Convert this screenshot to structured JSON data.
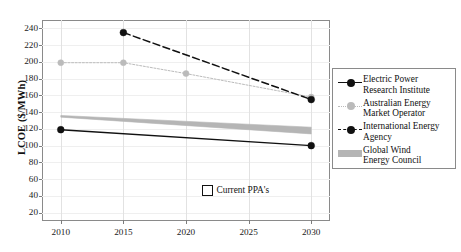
{
  "chart_data": {
    "type": "line",
    "title": "",
    "xlabel": "",
    "ylabel": "LCOE ($/MWh)",
    "xlim": [
      2008.5,
      2031.5
    ],
    "ylim": [
      10,
      250
    ],
    "xticks": [
      2010,
      2015,
      2020,
      2025,
      2030
    ],
    "yticks": [
      20,
      40,
      60,
      80,
      100,
      120,
      140,
      160,
      180,
      200,
      220,
      240
    ],
    "grid": true,
    "legend_position": "right-outside",
    "series": [
      {
        "name": "Electric Power Research Institute",
        "key": "epri",
        "color": "#111111",
        "style": "solid-with-markers",
        "x": [
          2010,
          2030
        ],
        "values": [
          119,
          100
        ]
      },
      {
        "name": "Australian Energy Market Operator",
        "key": "aemo",
        "color": "#bbbbbb",
        "style": "dotted-with-markers",
        "x": [
          2010,
          2015,
          2020,
          2030
        ],
        "values": [
          199,
          199,
          186,
          158
        ]
      },
      {
        "name": "International Energy Agency",
        "key": "iea",
        "color": "#111111",
        "style": "dashed-with-markers",
        "x": [
          2015,
          2030
        ],
        "values": [
          235,
          155
        ]
      },
      {
        "name": "Global Wind Energy Council",
        "key": "gwec",
        "color": "#b5b5b5",
        "style": "band",
        "x": [
          2010,
          2030
        ],
        "band_upper": [
          136,
          122
        ],
        "band_lower": [
          134,
          114
        ]
      }
    ],
    "annotations": [
      {
        "label": "Current PPA's",
        "swatch": "open-square",
        "x": 2021.2,
        "y": 48
      }
    ]
  },
  "legend": {
    "items": [
      {
        "label_line1": "Electric Power",
        "label_line2": "Research Institute",
        "key": "epri"
      },
      {
        "label_line1": "Australian Energy",
        "label_line2": "Market Operator",
        "key": "aemo"
      },
      {
        "label_line1": "International Energy",
        "label_line2": "Agency",
        "key": "iea"
      },
      {
        "label_line1": "Global Wind",
        "label_line2": "Energy Council",
        "key": "gwec"
      }
    ]
  },
  "axis": {
    "ylabel": "LCOE ($/MWh)",
    "ytick_labels": [
      "240",
      "220",
      "200",
      "180",
      "160",
      "140",
      "120",
      "100",
      "80",
      "60",
      "40",
      "20"
    ],
    "xtick_labels": [
      "2010",
      "2015",
      "2020",
      "2025",
      "2030"
    ]
  },
  "annotation": {
    "ppa_label": "Current PPA's"
  },
  "colors": {
    "dark": "#111111",
    "light_grey": "#bbbbbb",
    "band_grey": "#b5b5b5",
    "grid": "#e6e6e6",
    "spine": "#8a8a8a"
  }
}
